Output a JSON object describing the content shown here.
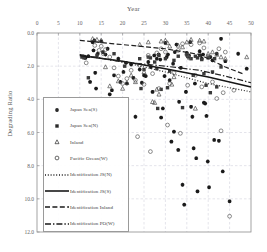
{
  "chart_data": {
    "type": "scatter",
    "title": "",
    "xlabel": "Year",
    "ylabel": "Degrading Ratio",
    "xlim": [
      0,
      50
    ],
    "ylim": [
      0,
      12
    ],
    "y_inverted": true,
    "grid": true,
    "x_axis_position": "top",
    "xticks": [
      0,
      5,
      10,
      15,
      20,
      25,
      30,
      35,
      40,
      45,
      50
    ],
    "xtick_labels": [
      "0",
      "5",
      "10",
      "15",
      "20",
      "25",
      "30",
      "35",
      "40",
      "45",
      "50"
    ],
    "yticks": [
      0,
      2,
      4,
      6,
      8,
      10,
      12
    ],
    "ytick_labels": [
      "0.0",
      "2.0",
      "4.0",
      "6.0",
      "8.0",
      "10.0",
      "12.0"
    ],
    "legend_position": "lower-left-inside",
    "series": [
      {
        "name": "Japan Sea(S)",
        "marker": "star-filled",
        "color": "#1a1a1a",
        "points": [
          [
            11.0,
            1.45
          ],
          [
            11.3,
            1.5
          ],
          [
            12.0,
            1.4
          ],
          [
            12.4,
            2.95
          ],
          [
            13.0,
            0.55
          ],
          [
            13.2,
            1.05
          ],
          [
            13.4,
            0.45
          ],
          [
            13.6,
            2.4
          ],
          [
            13.8,
            3.35
          ],
          [
            14.2,
            1.25
          ],
          [
            15.0,
            0.5
          ],
          [
            15.4,
            1.15
          ],
          [
            16.0,
            1.3
          ],
          [
            16.5,
            0.95
          ],
          [
            17.0,
            3.7
          ],
          [
            18.0,
            2.55
          ],
          [
            19.0,
            1.55
          ],
          [
            19.5,
            2.95
          ],
          [
            20.2,
            2.35
          ],
          [
            21.0,
            3.05
          ],
          [
            22.0,
            1.9
          ],
          [
            22.5,
            2.7
          ],
          [
            23.0,
            5.05
          ],
          [
            24.0,
            2.2
          ],
          [
            25.0,
            2.55
          ],
          [
            25.4,
            2.6
          ],
          [
            26.0,
            1.75
          ],
          [
            26.6,
            2.05
          ],
          [
            27.0,
            3.55
          ],
          [
            27.4,
            1.35
          ],
          [
            28.0,
            1.55
          ],
          [
            28.4,
            1.3
          ],
          [
            28.8,
            1.6
          ],
          [
            29.0,
            5.1
          ],
          [
            29.4,
            4.55
          ],
          [
            30.0,
            0.6
          ],
          [
            30.3,
            1.45
          ],
          [
            30.6,
            1.3
          ],
          [
            31.0,
            2.85
          ],
          [
            31.4,
            6.55
          ],
          [
            32.0,
            5.95
          ],
          [
            32.2,
            1.15
          ],
          [
            32.6,
            0.7
          ],
          [
            33.0,
            7.05
          ],
          [
            33.2,
            4.15
          ],
          [
            33.6,
            2.1
          ],
          [
            34.0,
            9.15
          ],
          [
            34.4,
            10.35
          ],
          [
            35.0,
            1.2
          ],
          [
            35.2,
            1.4
          ],
          [
            35.5,
            1.35
          ],
          [
            35.8,
            0.55
          ],
          [
            36.0,
            4.45
          ],
          [
            36.3,
            5.05
          ],
          [
            36.6,
            6.95
          ],
          [
            36.9,
            3.05
          ],
          [
            37.2,
            7.55
          ],
          [
            37.5,
            9.55
          ],
          [
            38.0,
            1.1
          ],
          [
            38.2,
            1.35
          ],
          [
            38.5,
            1.55
          ],
          [
            38.8,
            1.3
          ],
          [
            39.0,
            4.2
          ],
          [
            39.3,
            4.25
          ],
          [
            39.6,
            5.0
          ],
          [
            39.9,
            7.75
          ],
          [
            40.2,
            9.3
          ],
          [
            40.5,
            1.45
          ],
          [
            41.0,
            1.65
          ],
          [
            41.4,
            6.45
          ],
          [
            42.0,
            1.25
          ],
          [
            42.5,
            6.5
          ],
          [
            43.0,
            0.35
          ],
          [
            43.4,
            8.35
          ],
          [
            44.0,
            1.7
          ],
          [
            45.0,
            10.15
          ],
          [
            47.0,
            1.25
          ],
          [
            49.0,
            2.15
          ],
          [
            17.5,
            3.45
          ],
          [
            20.8,
            1.8
          ],
          [
            24.5,
            3.0
          ],
          [
            29.8,
            2.6
          ],
          [
            31.8,
            1.85
          ],
          [
            34.8,
            3.55
          ]
        ]
      },
      {
        "name": "Japan Sea(N)",
        "marker": "square-filled",
        "color": "#3a3a3a",
        "points": [
          [
            10.5,
            1.45
          ],
          [
            11.0,
            1.5
          ],
          [
            12.0,
            2.7
          ],
          [
            14.0,
            1.35
          ],
          [
            18.0,
            1.25
          ],
          [
            20.5,
            2.0
          ],
          [
            24.0,
            1.55
          ],
          [
            25.0,
            2.2
          ],
          [
            26.0,
            1.45
          ],
          [
            26.5,
            1.5
          ],
          [
            27.5,
            1.75
          ],
          [
            28.0,
            2.15
          ],
          [
            28.5,
            1.35
          ],
          [
            29.0,
            3.4
          ],
          [
            30.0,
            1.55
          ],
          [
            31.0,
            2.3
          ],
          [
            32.0,
            1.65
          ],
          [
            33.0,
            1.4
          ],
          [
            34.0,
            4.5
          ],
          [
            35.0,
            1.3
          ],
          [
            35.5,
            1.45
          ],
          [
            36.0,
            1.55
          ],
          [
            36.5,
            2.55
          ],
          [
            37.0,
            1.4
          ],
          [
            37.5,
            1.5
          ],
          [
            38.0,
            1.35
          ],
          [
            38.5,
            1.6
          ],
          [
            39.0,
            2.45
          ],
          [
            39.5,
            3.15
          ],
          [
            40.0,
            1.5
          ],
          [
            40.5,
            3.6
          ],
          [
            41.0,
            2.35
          ],
          [
            41.5,
            1.55
          ],
          [
            42.0,
            3.25
          ],
          [
            43.0,
            2.05
          ],
          [
            28.2,
            4.55
          ],
          [
            24.3,
            3.35
          ],
          [
            30.5,
            3.3
          ]
        ]
      },
      {
        "name": "Inland",
        "marker": "triangle-open",
        "color": "#4a4a4a",
        "points": [
          [
            13.0,
            0.35
          ],
          [
            14.0,
            0.4
          ],
          [
            15.0,
            0.45
          ],
          [
            16.0,
            2.05
          ],
          [
            17.0,
            3.2
          ],
          [
            19.0,
            2.9
          ],
          [
            21.0,
            3.0
          ],
          [
            22.0,
            2.55
          ],
          [
            23.0,
            2.95
          ],
          [
            24.0,
            0.7
          ],
          [
            25.0,
            2.35
          ],
          [
            26.0,
            0.55
          ],
          [
            27.0,
            4.15
          ],
          [
            27.5,
            4.2
          ],
          [
            28.0,
            3.4
          ],
          [
            28.5,
            3.7
          ],
          [
            29.0,
            0.5
          ],
          [
            30.0,
            0.45
          ],
          [
            30.5,
            0.6
          ],
          [
            31.0,
            0.8
          ],
          [
            32.0,
            2.65
          ],
          [
            33.0,
            0.75
          ],
          [
            34.0,
            0.85
          ],
          [
            35.0,
            0.55
          ],
          [
            36.0,
            0.4
          ],
          [
            37.0,
            4.55
          ],
          [
            38.0,
            0.45
          ],
          [
            39.0,
            0.5
          ],
          [
            40.0,
            1.25
          ],
          [
            41.0,
            1.15
          ],
          [
            42.0,
            1.3
          ],
          [
            43.0,
            1.45
          ],
          [
            44.0,
            1.55
          ],
          [
            49.0,
            1.45
          ],
          [
            20.0,
            3.35
          ],
          [
            31.5,
            3.1
          ]
        ]
      },
      {
        "name": "Pacific Ocean(W)",
        "marker": "circle-open",
        "color": "#5a5a5a",
        "points": [
          [
            11.5,
            1.8
          ],
          [
            13.5,
            0.75
          ],
          [
            14.5,
            1.05
          ],
          [
            15.0,
            0.8
          ],
          [
            15.5,
            1.25
          ],
          [
            16.0,
            1.0
          ],
          [
            17.0,
            1.45
          ],
          [
            18.0,
            2.1
          ],
          [
            19.0,
            2.6
          ],
          [
            20.0,
            3.05
          ],
          [
            21.0,
            2.75
          ],
          [
            22.0,
            2.25
          ],
          [
            23.0,
            2.85
          ],
          [
            24.0,
            1.95
          ],
          [
            25.0,
            3.1
          ],
          [
            26.0,
            1.35
          ],
          [
            27.0,
            2.45
          ],
          [
            28.0,
            1.2
          ],
          [
            28.5,
            3.35
          ],
          [
            29.0,
            0.95
          ],
          [
            30.0,
            1.15
          ],
          [
            30.5,
            5.55
          ],
          [
            31.0,
            3.05
          ],
          [
            32.0,
            2.4
          ],
          [
            33.0,
            1.05
          ],
          [
            34.0,
            0.65
          ],
          [
            35.0,
            1.3
          ],
          [
            35.5,
            1.5
          ],
          [
            36.0,
            0.7
          ],
          [
            37.0,
            2.55
          ],
          [
            38.0,
            0.6
          ],
          [
            38.5,
            3.25
          ],
          [
            39.0,
            0.9
          ],
          [
            40.0,
            1.4
          ],
          [
            41.0,
            2.95
          ],
          [
            42.0,
            3.95
          ],
          [
            42.5,
            0.95
          ],
          [
            43.0,
            5.9
          ],
          [
            43.5,
            3.6
          ],
          [
            44.0,
            1.15
          ],
          [
            45.0,
            11.05
          ],
          [
            46.0,
            3.45
          ],
          [
            23.5,
            6.25
          ],
          [
            26.5,
            7.15
          ],
          [
            33.5,
            6.05
          ],
          [
            35.2,
            3.15
          ]
        ]
      }
    ],
    "trend_lines": [
      {
        "name": "Identification JS(N)",
        "style": "dotted",
        "color": "#2a2a2a",
        "points": [
          [
            10,
            1.3
          ],
          [
            20,
            1.75
          ],
          [
            30,
            2.35
          ],
          [
            40,
            3.05
          ],
          [
            50,
            3.55
          ]
        ]
      },
      {
        "name": "Identification JS(S)",
        "style": "solid",
        "color": "#161616",
        "points": [
          [
            10,
            1.35
          ],
          [
            20,
            1.7
          ],
          [
            30,
            2.15
          ],
          [
            40,
            2.65
          ],
          [
            50,
            3.25
          ]
        ]
      },
      {
        "name": "Identification Inland",
        "style": "dashed",
        "color": "#1f1f1f",
        "points": [
          [
            10,
            0.45
          ],
          [
            20,
            0.7
          ],
          [
            30,
            0.95
          ],
          [
            38,
            1.3
          ],
          [
            44,
            2.05
          ],
          [
            48,
            2.45
          ]
        ]
      },
      {
        "name": "Identification PO(W)",
        "style": "dash-dot",
        "color": "#242424",
        "points": [
          [
            10,
            1.3
          ],
          [
            20,
            1.75
          ],
          [
            30,
            2.0
          ],
          [
            38,
            2.25
          ],
          [
            44,
            2.6
          ],
          [
            50,
            3.0
          ]
        ]
      }
    ]
  },
  "legend": {
    "entries": [
      {
        "label": "Japan Sea(S)",
        "symbol": "star-filled"
      },
      {
        "label": "Japan Sea(N)",
        "symbol": "square-filled"
      },
      {
        "label": "Inland",
        "symbol": "triangle-open"
      },
      {
        "label": "Pacific Ocean(W)",
        "symbol": "circle-open"
      },
      {
        "label": "Identification JS(N)",
        "symbol": "line-dotted"
      },
      {
        "label": "Identification JS(S)",
        "symbol": "line-solid"
      },
      {
        "label": "Identification Inland",
        "symbol": "line-dashed"
      },
      {
        "label": "Identification PO(W)",
        "symbol": "line-dash-dot"
      }
    ]
  },
  "colors": {
    "grid": "#c9c9d6",
    "frame": "#8d8d8d",
    "text": "#555555"
  }
}
